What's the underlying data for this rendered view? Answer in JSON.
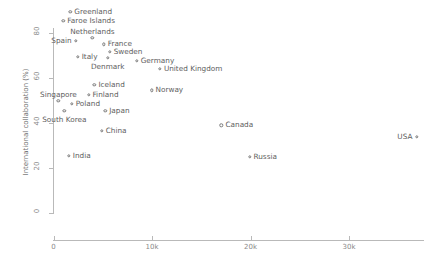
{
  "chart_data": {
    "type": "scatter",
    "title": "",
    "xlabel": "",
    "ylabel": "International collaboration (%)",
    "xlim": [
      -1500,
      37500
    ],
    "ylim": [
      0,
      88
    ],
    "grid": false,
    "legend": "none",
    "xticks": [
      {
        "value": 0,
        "label": "0"
      },
      {
        "value": 10000,
        "label": "10k"
      },
      {
        "value": 20000,
        "label": "20k"
      },
      {
        "value": 30000,
        "label": "30k"
      }
    ],
    "yticks": [
      {
        "value": 0,
        "label": "0"
      },
      {
        "value": 20,
        "label": "20"
      },
      {
        "value": 40,
        "label": "40"
      },
      {
        "value": 60,
        "label": "60"
      },
      {
        "value": 80,
        "label": "80"
      }
    ],
    "marker_color": "#7a7a7a",
    "points": [
      {
        "name": "Greenland",
        "x": 1700,
        "y": 89.5,
        "label_pos": "right"
      },
      {
        "name": "Faroe Islands",
        "x": 1000,
        "y": 85.5,
        "label_pos": "right"
      },
      {
        "name": "Spain",
        "x": 2250,
        "y": 76.5,
        "label_pos": "left"
      },
      {
        "name": "Netherlands",
        "x": 3950,
        "y": 78.0,
        "label_pos": "above"
      },
      {
        "name": "France",
        "x": 5100,
        "y": 75.0,
        "label_pos": "right"
      },
      {
        "name": "Italy",
        "x": 2450,
        "y": 69.5,
        "label_pos": "right"
      },
      {
        "name": "Sweden",
        "x": 5700,
        "y": 71.5,
        "label_pos": "right"
      },
      {
        "name": "Denmark",
        "x": 5500,
        "y": 69.0,
        "label_pos": "below"
      },
      {
        "name": "Germany",
        "x": 8450,
        "y": 67.5,
        "label_pos": "right"
      },
      {
        "name": "United Kingdom",
        "x": 10800,
        "y": 64.0,
        "label_pos": "right"
      },
      {
        "name": "Iceland",
        "x": 4150,
        "y": 57.0,
        "label_pos": "right"
      },
      {
        "name": "Norway",
        "x": 9950,
        "y": 54.5,
        "label_pos": "right"
      },
      {
        "name": "Finland",
        "x": 3550,
        "y": 52.5,
        "label_pos": "right"
      },
      {
        "name": "Singapore",
        "x": 500,
        "y": 50.0,
        "label_pos": "above"
      },
      {
        "name": "Poland",
        "x": 1850,
        "y": 48.5,
        "label_pos": "right"
      },
      {
        "name": "South Korea",
        "x": 1100,
        "y": 45.5,
        "label_pos": "below"
      },
      {
        "name": "Japan",
        "x": 5250,
        "y": 45.5,
        "label_pos": "right"
      },
      {
        "name": "China",
        "x": 4900,
        "y": 36.5,
        "label_pos": "right"
      },
      {
        "name": "Canada",
        "x": 17050,
        "y": 39.0,
        "label_pos": "right"
      },
      {
        "name": "USA",
        "x": 36850,
        "y": 34.0,
        "label_pos": "left"
      },
      {
        "name": "India",
        "x": 1550,
        "y": 25.5,
        "label_pos": "right"
      },
      {
        "name": "Russia",
        "x": 19900,
        "y": 25.0,
        "label_pos": "right"
      }
    ]
  }
}
